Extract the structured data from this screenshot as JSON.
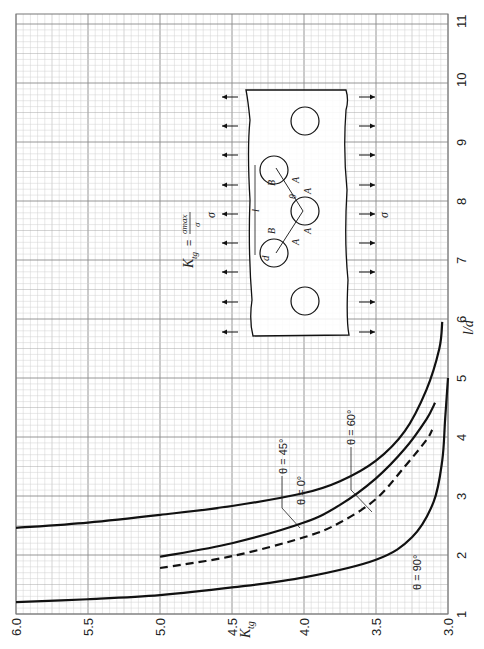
{
  "chart_data": {
    "type": "line",
    "orientation": "rotated 90° counter-clockwise (K_tg axis along bottom, l/d axis along right)",
    "title": "",
    "xlabel": "l/d",
    "ylabel": "K_tg",
    "xlim": [
      1,
      11
    ],
    "ylim": [
      3.0,
      6.0
    ],
    "x_ticks": [
      "1",
      "2",
      "3",
      "4",
      "5",
      "6",
      "7",
      "8",
      "9",
      "10",
      "11"
    ],
    "y_ticks": [
      "3.0",
      "3.5",
      "4.0",
      "4.5",
      "5.0",
      "5.5",
      "6.0"
    ],
    "grid": true,
    "formula": "K_tg = σ_max / σ",
    "series": [
      {
        "name": "θ = 0°",
        "style": "solid",
        "points": [
          [
            2.46,
            6.0
          ],
          [
            2.55,
            5.5
          ],
          [
            2.68,
            5.0
          ],
          [
            2.83,
            4.5
          ],
          [
            3.05,
            4.0
          ],
          [
            3.25,
            3.75
          ],
          [
            3.6,
            3.5
          ],
          [
            4.1,
            3.3
          ],
          [
            4.8,
            3.15
          ],
          [
            5.5,
            3.06
          ],
          [
            5.95,
            3.04
          ]
        ]
      },
      {
        "name": "θ = 45°",
        "style": "solid",
        "points": [
          [
            1.97,
            5.0
          ],
          [
            2.2,
            4.5
          ],
          [
            2.55,
            4.0
          ],
          [
            2.85,
            3.75
          ],
          [
            3.3,
            3.5
          ],
          [
            3.8,
            3.3
          ],
          [
            4.3,
            3.15
          ],
          [
            4.58,
            3.09
          ]
        ]
      },
      {
        "name": "θ = 60°",
        "style": "dashed",
        "points": [
          [
            1.78,
            5.0
          ],
          [
            1.98,
            4.5
          ],
          [
            2.3,
            4.0
          ],
          [
            2.55,
            3.75
          ],
          [
            2.95,
            3.5
          ],
          [
            3.5,
            3.3
          ],
          [
            3.95,
            3.15
          ],
          [
            4.12,
            3.11
          ]
        ]
      },
      {
        "name": "θ = 90°",
        "style": "solid",
        "points": [
          [
            1.2,
            6.0
          ],
          [
            1.25,
            5.5
          ],
          [
            1.32,
            5.0
          ],
          [
            1.45,
            4.5
          ],
          [
            1.62,
            4.0
          ],
          [
            1.92,
            3.5
          ],
          [
            2.3,
            3.25
          ],
          [
            2.9,
            3.1
          ],
          [
            3.6,
            3.04
          ],
          [
            4.3,
            3.02
          ],
          [
            5.0,
            3.0
          ]
        ]
      }
    ],
    "annotations": [
      "θ = 0°",
      "θ = 45°",
      "θ = 60°",
      "θ = 90°"
    ],
    "inset_diagram": {
      "description": "Plate with staggered row of circular holes under uniaxial tension σ",
      "labels": [
        "σ",
        "σ",
        "l",
        "d",
        "B",
        "B",
        "θ",
        "A",
        "A",
        "A",
        "A"
      ]
    }
  },
  "labels": {
    "y_axis": "K",
    "y_axis_sub": "tg",
    "x_axis": "l/d",
    "formula_lhs": "K",
    "formula_sub": "tg",
    "formula_eq": "=",
    "formula_num": "σmax",
    "formula_den": "σ",
    "sigma": "σ",
    "theta0": "θ = 0°",
    "theta45": "θ = 45°",
    "theta60": "θ = 60°",
    "theta90": "θ = 90°",
    "l": "l",
    "d": "d",
    "B": "B",
    "A": "A",
    "theta": "θ"
  },
  "colors": {
    "grid_minor": "#c8c8c8",
    "grid_major": "#8a8a8a",
    "curve": "#111111",
    "background": "#ffffff"
  }
}
